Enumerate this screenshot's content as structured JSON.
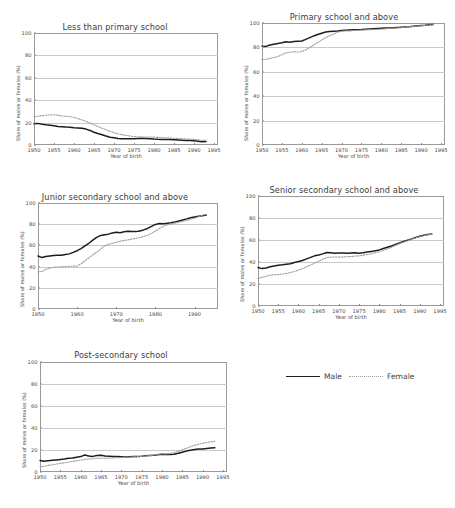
{
  "legend": {
    "items": [
      {
        "label": "Male",
        "style": "solid",
        "color": "#1d1d1d"
      },
      {
        "label": "Female",
        "style": "dotted",
        "color": "#9e9e9e"
      }
    ]
  },
  "axis_common": {
    "xlabel": "Year of birth",
    "ylabel": "Share of males or females (%)",
    "ylim": [
      0,
      100
    ],
    "yticks": [
      0,
      20,
      40,
      60,
      80,
      100
    ],
    "grid": true
  },
  "chart_data": [
    {
      "type": "line",
      "title": "Less than primary school",
      "xlabel": "Year of birth",
      "ylabel": "Share of males or females (%)",
      "xlim": [
        1950,
        1996
      ],
      "ylim": [
        0,
        100
      ],
      "xticks": [
        1950,
        1955,
        1960,
        1965,
        1970,
        1975,
        1980,
        1985,
        1990,
        1995
      ],
      "yticks": [
        0,
        20,
        40,
        60,
        80,
        100
      ],
      "x": [
        1950,
        1951,
        1952,
        1953,
        1954,
        1955,
        1956,
        1957,
        1958,
        1959,
        1960,
        1961,
        1962,
        1963,
        1964,
        1965,
        1966,
        1967,
        1968,
        1969,
        1970,
        1971,
        1972,
        1973,
        1974,
        1975,
        1976,
        1977,
        1978,
        1979,
        1980,
        1981,
        1982,
        1983,
        1984,
        1985,
        1986,
        1987,
        1988,
        1989,
        1990,
        1991,
        1992,
        1993
      ],
      "series": [
        {
          "name": "Male",
          "values": [
            19.0,
            19.3,
            18.5,
            18.0,
            17.6,
            17.2,
            16.6,
            16.3,
            16.0,
            15.8,
            15.4,
            15.2,
            15.0,
            14.2,
            13.0,
            11.4,
            10.2,
            9.2,
            8.0,
            7.0,
            6.4,
            5.8,
            5.6,
            5.6,
            5.5,
            5.6,
            5.8,
            6.0,
            5.9,
            5.6,
            5.3,
            5.1,
            5.0,
            5.0,
            4.9,
            4.7,
            4.5,
            4.3,
            4.1,
            4.0,
            3.8,
            3.4,
            3.0,
            3.1
          ]
        },
        {
          "name": "Female",
          "values": [
            25.0,
            25.6,
            26.2,
            26.6,
            26.9,
            27.0,
            26.6,
            26.0,
            25.6,
            25.3,
            24.6,
            23.6,
            22.4,
            21.0,
            19.6,
            18.0,
            16.4,
            15.0,
            13.6,
            12.2,
            11.0,
            10.0,
            9.2,
            8.6,
            8.0,
            7.6,
            7.3,
            7.2,
            7.2,
            7.1,
            7.0,
            6.8,
            6.6,
            6.4,
            6.2,
            6.0,
            5.8,
            5.6,
            5.4,
            5.2,
            5.0,
            4.6,
            4.2,
            4.3
          ]
        }
      ]
    },
    {
      "type": "line",
      "title": "Primary school and above",
      "xlabel": "Year of birth",
      "ylabel": "Share of males or females (%)",
      "xlim": [
        1950,
        1996
      ],
      "ylim": [
        0,
        100
      ],
      "xticks": [
        1950,
        1955,
        1960,
        1965,
        1970,
        1975,
        1980,
        1985,
        1990,
        1995
      ],
      "yticks": [
        0,
        20,
        40,
        60,
        80,
        100
      ],
      "x": [
        1950,
        1951,
        1952,
        1953,
        1954,
        1955,
        1956,
        1957,
        1958,
        1959,
        1960,
        1961,
        1962,
        1963,
        1964,
        1965,
        1966,
        1967,
        1968,
        1969,
        1970,
        1971,
        1972,
        1973,
        1974,
        1975,
        1976,
        1977,
        1978,
        1979,
        1980,
        1981,
        1982,
        1983,
        1984,
        1985,
        1986,
        1987,
        1988,
        1989,
        1990,
        1991,
        1992,
        1993
      ],
      "series": [
        {
          "name": "Male",
          "values": [
            81.0,
            80.8,
            82.0,
            82.6,
            83.2,
            83.8,
            84.6,
            84.2,
            84.8,
            85.0,
            85.2,
            86.6,
            88.0,
            89.4,
            90.6,
            91.6,
            92.6,
            93.0,
            93.2,
            93.4,
            93.8,
            94.0,
            94.2,
            94.4,
            94.5,
            94.6,
            94.8,
            95.0,
            95.2,
            95.4,
            95.6,
            95.8,
            96.0,
            96.2,
            96.4,
            96.6,
            96.8,
            97.0,
            97.3,
            97.6,
            97.9,
            98.2,
            98.6,
            98.8
          ]
        },
        {
          "name": "Female",
          "values": [
            70.0,
            70.2,
            71.0,
            71.6,
            72.6,
            74.0,
            75.6,
            76.0,
            76.4,
            76.2,
            76.6,
            78.0,
            80.0,
            82.0,
            84.0,
            86.0,
            88.0,
            89.6,
            91.0,
            92.4,
            93.2,
            93.6,
            93.4,
            93.8,
            94.0,
            94.2,
            94.4,
            94.6,
            94.6,
            94.8,
            95.0,
            95.2,
            95.6,
            95.8,
            96.0,
            96.2,
            96.6,
            97.0,
            97.2,
            97.5,
            97.8,
            98.0,
            98.4,
            98.6
          ]
        }
      ]
    },
    {
      "type": "line",
      "title": "Junior secondary school and above",
      "xlabel": "Year of birth",
      "ylabel": "Share of males or females (%)",
      "xlim": [
        1950,
        1996
      ],
      "ylim": [
        0,
        100
      ],
      "xticks": [
        1950,
        1960,
        1970,
        1980,
        1990
      ],
      "yticks": [
        0,
        20,
        40,
        60,
        80,
        100
      ],
      "x": [
        1950,
        1951,
        1952,
        1953,
        1954,
        1955,
        1956,
        1957,
        1958,
        1959,
        1960,
        1961,
        1962,
        1963,
        1964,
        1965,
        1966,
        1967,
        1968,
        1969,
        1970,
        1971,
        1972,
        1973,
        1974,
        1975,
        1976,
        1977,
        1978,
        1979,
        1980,
        1981,
        1982,
        1983,
        1984,
        1985,
        1986,
        1987,
        1988,
        1989,
        1990,
        1991,
        1992,
        1993
      ],
      "series": [
        {
          "name": "Male",
          "values": [
            50.0,
            48.5,
            49.5,
            50.0,
            50.4,
            50.6,
            50.8,
            51.4,
            52.0,
            53.4,
            55.0,
            57.0,
            59.6,
            62.0,
            65.0,
            67.6,
            69.4,
            70.0,
            70.6,
            71.8,
            72.4,
            72.0,
            72.8,
            73.4,
            73.2,
            73.0,
            73.6,
            74.6,
            76.0,
            78.0,
            79.8,
            80.6,
            80.4,
            80.8,
            81.4,
            82.2,
            83.0,
            84.0,
            85.0,
            86.0,
            86.8,
            87.4,
            88.0,
            88.6
          ]
        },
        {
          "name": "Female",
          "values": [
            35.0,
            35.4,
            37.4,
            38.6,
            39.4,
            39.6,
            39.8,
            40.0,
            40.2,
            40.4,
            40.6,
            42.6,
            45.4,
            48.4,
            51.0,
            53.6,
            56.4,
            59.4,
            61.0,
            62.0,
            63.0,
            64.0,
            64.6,
            65.2,
            66.0,
            66.6,
            67.4,
            68.4,
            69.6,
            71.4,
            73.6,
            76.0,
            78.0,
            79.4,
            80.2,
            81.0,
            81.8,
            82.6,
            83.6,
            84.6,
            85.6,
            87.0,
            88.4,
            89.4
          ]
        }
      ]
    },
    {
      "type": "line",
      "title": "Senior secondary school and above",
      "xlabel": "Year of birth",
      "ylabel": "Share of males or females (%)",
      "xlim": [
        1950,
        1996
      ],
      "ylim": [
        0,
        100
      ],
      "xticks": [
        1950,
        1955,
        1960,
        1965,
        1970,
        1975,
        1980,
        1985,
        1990,
        1995
      ],
      "yticks": [
        0,
        20,
        40,
        60,
        80,
        100
      ],
      "x": [
        1950,
        1951,
        1952,
        1953,
        1954,
        1955,
        1956,
        1957,
        1958,
        1959,
        1960,
        1961,
        1962,
        1963,
        1964,
        1965,
        1966,
        1967,
        1968,
        1969,
        1970,
        1971,
        1972,
        1973,
        1974,
        1975,
        1976,
        1977,
        1978,
        1979,
        1980,
        1981,
        1982,
        1983,
        1984,
        1985,
        1986,
        1987,
        1988,
        1989,
        1990,
        1991,
        1992,
        1993
      ],
      "series": [
        {
          "name": "Male",
          "values": [
            35.0,
            34.0,
            34.6,
            35.6,
            36.4,
            37.0,
            37.4,
            38.0,
            38.4,
            39.6,
            40.4,
            41.4,
            42.8,
            44.2,
            45.6,
            46.4,
            47.4,
            48.6,
            48.4,
            48.0,
            48.2,
            48.2,
            48.0,
            48.2,
            48.4,
            48.0,
            48.4,
            49.0,
            49.6,
            50.2,
            51.0,
            52.2,
            53.4,
            54.6,
            56.0,
            57.4,
            58.6,
            59.8,
            61.0,
            62.2,
            63.4,
            64.4,
            65.0,
            65.4
          ]
        },
        {
          "name": "Female",
          "values": [
            25.0,
            26.0,
            27.0,
            28.0,
            28.4,
            28.6,
            29.0,
            29.6,
            30.4,
            31.4,
            32.6,
            34.0,
            35.6,
            37.2,
            39.0,
            40.6,
            42.4,
            44.0,
            44.4,
            44.6,
            44.4,
            44.6,
            44.8,
            45.0,
            45.4,
            45.6,
            46.2,
            46.8,
            47.4,
            48.4,
            49.4,
            50.6,
            52.0,
            53.4,
            55.0,
            56.6,
            58.0,
            59.4,
            60.8,
            62.0,
            63.0,
            64.0,
            64.8,
            65.2
          ]
        }
      ]
    },
    {
      "type": "line",
      "title": "Post-secondary school",
      "xlabel": "Year of birth",
      "ylabel": "Share of males or females (%)",
      "xlim": [
        1950,
        1996
      ],
      "ylim": [
        0,
        100
      ],
      "xticks": [
        1950,
        1955,
        1960,
        1965,
        1970,
        1975,
        1980,
        1985,
        1990,
        1995
      ],
      "yticks": [
        0,
        20,
        40,
        60,
        80,
        100
      ],
      "x": [
        1950,
        1951,
        1952,
        1953,
        1954,
        1955,
        1956,
        1957,
        1958,
        1959,
        1960,
        1961,
        1962,
        1963,
        1964,
        1965,
        1966,
        1967,
        1968,
        1969,
        1970,
        1971,
        1972,
        1973,
        1974,
        1975,
        1976,
        1977,
        1978,
        1979,
        1980,
        1981,
        1982,
        1983,
        1984,
        1985,
        1986,
        1987,
        1988,
        1989,
        1990,
        1991,
        1992,
        1993
      ],
      "series": [
        {
          "name": "Male",
          "values": [
            10.5,
            9.8,
            10.2,
            10.6,
            11.0,
            11.4,
            11.8,
            12.4,
            12.8,
            13.4,
            14.0,
            15.4,
            14.6,
            14.2,
            15.0,
            15.2,
            14.6,
            14.4,
            14.2,
            14.0,
            13.8,
            13.6,
            13.8,
            14.0,
            14.2,
            14.4,
            14.8,
            15.0,
            15.2,
            15.6,
            16.2,
            16.0,
            15.8,
            16.2,
            17.0,
            18.0,
            19.0,
            19.8,
            20.4,
            20.8,
            21.0,
            21.4,
            21.8,
            22.0
          ]
        },
        {
          "name": "Female",
          "values": [
            5.0,
            5.2,
            6.0,
            6.6,
            7.2,
            7.8,
            8.4,
            9.0,
            9.6,
            10.2,
            10.8,
            11.4,
            11.8,
            12.0,
            12.4,
            12.6,
            12.4,
            12.6,
            12.8,
            13.0,
            13.2,
            13.4,
            13.6,
            13.8,
            14.0,
            14.2,
            14.6,
            15.0,
            15.4,
            16.0,
            16.6,
            16.4,
            16.8,
            17.6,
            18.8,
            20.2,
            21.6,
            23.0,
            24.2,
            25.2,
            26.0,
            26.8,
            27.4,
            28.0
          ]
        }
      ]
    }
  ]
}
